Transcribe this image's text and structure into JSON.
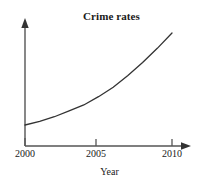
{
  "chart_data": {
    "type": "line",
    "title": "Crime rates",
    "xlabel": "Year",
    "ylabel": "",
    "grid": false,
    "legend": false,
    "xlim": [
      2000,
      2010
    ],
    "ylim": [
      0,
      100
    ],
    "xticks": [
      "2000",
      "2005",
      "2010"
    ],
    "xtick_values": [
      2000,
      2005,
      2010
    ],
    "yticks": [],
    "axis_arrows": {
      "x": true,
      "y": true
    },
    "x": [
      2000,
      2001,
      2002,
      2003,
      2004,
      2005,
      2006,
      2007,
      2008,
      2009,
      2010
    ],
    "series": [
      {
        "name": "Crime rate",
        "values": [
          18,
          21,
          25,
          30,
          35,
          42,
          50,
          60,
          71,
          83,
          96
        ],
        "color": "#333333"
      }
    ],
    "annotations": []
  },
  "colors": {
    "background": "#ffffff",
    "axis": "#555555",
    "curve": "#333333",
    "text": "#1a1a1a"
  },
  "labels": {
    "title": "Crime rates",
    "x_axis_title": "Year",
    "tick_2000": "2000",
    "tick_2005": "2005",
    "tick_2010": "2010"
  }
}
